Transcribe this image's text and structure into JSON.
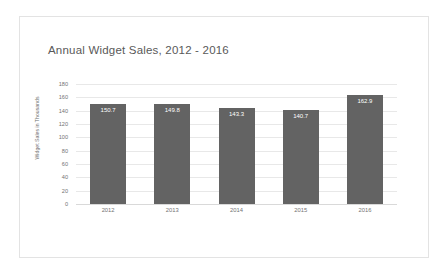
{
  "chart_data": {
    "type": "bar",
    "title": "Annual Widget Sales, 2012 - 2016",
    "xlabel": "",
    "ylabel": "Widget Sales in Thousands",
    "categories": [
      "2012",
      "2013",
      "2014",
      "2015",
      "2016"
    ],
    "values": [
      150.7,
      149.8,
      143.3,
      140.7,
      162.9
    ],
    "labels": [
      "150.7",
      "149.8",
      "143.3",
      "140.7",
      "162.9"
    ],
    "ylim": [
      0,
      180
    ],
    "yticks": [
      180,
      160,
      140,
      120,
      100,
      80,
      60,
      40,
      20,
      0
    ],
    "ytick_labels": [
      "180",
      "160",
      "140",
      "120",
      "100",
      "80",
      "60",
      "40",
      "20",
      "0"
    ],
    "grid": true,
    "legend": false,
    "bar_color": "#636363",
    "label_color": "#ffffff",
    "grid_color": "#e8e8e8",
    "text_color": "#737373",
    "title_color": "#595959",
    "background": "#ffffff",
    "card_border": "#e3e3e3"
  }
}
